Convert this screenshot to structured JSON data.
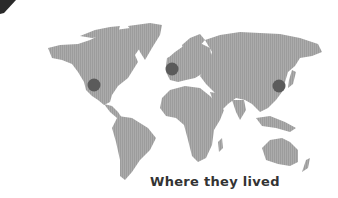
{
  "caption": "Where they lived",
  "colors": {
    "land": "#a9a9a9",
    "land_stripe": "#9a9a9a",
    "marker": "#5b5b5b",
    "caption": "#333333",
    "corner_mark": "#2a2a2a"
  },
  "markers": [
    {
      "name": "western-united-states",
      "x": 94,
      "y": 85,
      "r": 6.5
    },
    {
      "name": "british-isles",
      "x": 172,
      "y": 69,
      "r": 6.5
    },
    {
      "name": "eastern-china",
      "x": 279,
      "y": 86,
      "r": 6.5
    }
  ]
}
